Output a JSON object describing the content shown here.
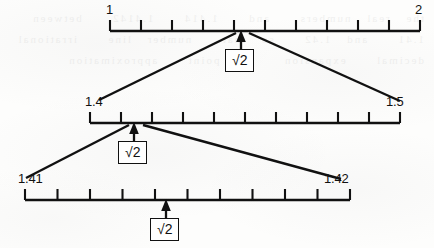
{
  "figure": {
    "ink_color": "#111111",
    "paper_color": "#fdfdfc",
    "bleed_through_text": "the real numbers  and  1.414  1.4142  between  1.41  and 1.42  so that  number line  irrational  decimal  expansion  the point  approximation"
  },
  "number_lines": [
    {
      "id": "line-1-to-2",
      "start_label": "1",
      "end_label": "2",
      "start_value": 1,
      "end_value": 2,
      "intervals": 10,
      "tick_count": 11,
      "marker_label": "√2",
      "marker_value": 1.4142,
      "marker_tick_index": 4
    },
    {
      "id": "line-1p4-to-1p5",
      "start_label": "1.4",
      "end_label": "1.5",
      "start_value": 1.4,
      "end_value": 1.5,
      "intervals": 10,
      "tick_count": 11,
      "marker_label": "√2",
      "marker_value": 1.4142,
      "marker_tick_index": 1
    },
    {
      "id": "line-1p41-to-1p42",
      "start_label": "1.41",
      "end_label": "1.42",
      "start_value": 1.41,
      "end_value": 1.42,
      "intervals": 10,
      "tick_count": 11,
      "marker_label": "√2",
      "marker_value": 1.4142,
      "marker_tick_index": 4
    }
  ],
  "magnifiers": [
    {
      "id": "magnifier-top",
      "from_line": "line-1-to-2",
      "to_line": "line-1p4-to-1p5",
      "source_label": "√2 neighbourhood 1.4 to 1.5"
    },
    {
      "id": "magnifier-middle",
      "from_line": "line-1p4-to-1p5",
      "to_line": "line-1p41-to-1p42",
      "source_label": "√2 neighbourhood 1.41 to 1.42"
    }
  ]
}
